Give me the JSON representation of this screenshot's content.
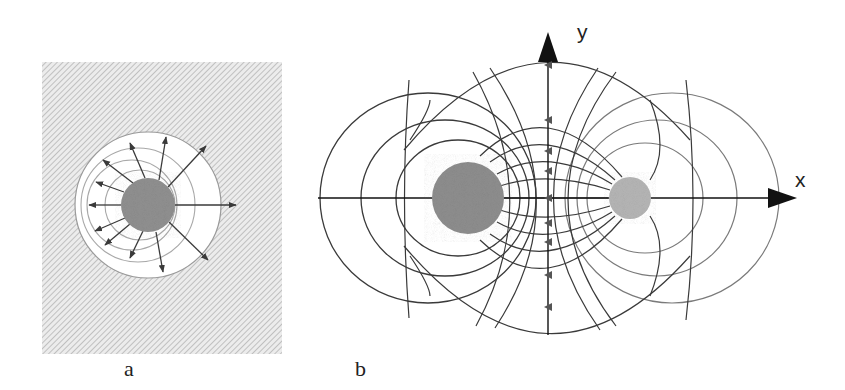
{
  "figure": {
    "panels": [
      {
        "id": "a",
        "label": "a",
        "description": "Single charge with radial field lines and concentric equipotential circles inside a hatched medium"
      },
      {
        "id": "b",
        "label": "b",
        "description": "Two unequal charges with field lines and equipotential curves on x-y axes"
      }
    ],
    "axes": {
      "x_label": "x",
      "y_label": "y"
    },
    "colors": {
      "charge_large": "#8c8c8c",
      "charge_small": "#b0b0b0",
      "field_line": "#3a3a3a",
      "equipotential": "#9a9a9a",
      "hatch": "#b8b8b8",
      "axis": "#111111"
    }
  }
}
